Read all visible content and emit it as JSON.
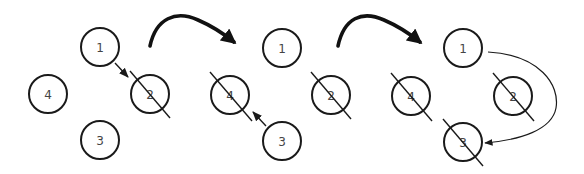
{
  "diagram": {
    "stroke_color": "#1a1a1a",
    "label_color": "#444444",
    "panels": [
      {
        "id": "panel-1",
        "nodes": [
          {
            "label": "1",
            "cx": 100,
            "cy": 47,
            "struck": false
          },
          {
            "label": "2",
            "cx": 150,
            "cy": 94,
            "struck": true
          },
          {
            "label": "3",
            "cx": 100,
            "cy": 140,
            "struck": false
          },
          {
            "label": "4",
            "cx": 48,
            "cy": 94,
            "struck": false
          }
        ],
        "arrows": [
          {
            "from": "1",
            "to": "2",
            "style": "short-dark"
          }
        ]
      },
      {
        "id": "panel-2",
        "nodes": [
          {
            "label": "1",
            "cx": 282,
            "cy": 48,
            "struck": false
          },
          {
            "label": "2",
            "cx": 331,
            "cy": 95,
            "struck": true
          },
          {
            "label": "3",
            "cx": 282,
            "cy": 141,
            "struck": false
          },
          {
            "label": "4",
            "cx": 230,
            "cy": 95,
            "struck": true
          }
        ],
        "arrows": [
          {
            "from": "3",
            "to": "4",
            "style": "short-dark"
          }
        ]
      },
      {
        "id": "panel-3",
        "nodes": [
          {
            "label": "1",
            "cx": 463,
            "cy": 48,
            "struck": false
          },
          {
            "label": "2",
            "cx": 513,
            "cy": 96,
            "struck": true
          },
          {
            "label": "3",
            "cx": 463,
            "cy": 142,
            "struck": true
          },
          {
            "label": "4",
            "cx": 411,
            "cy": 96,
            "struck": true
          }
        ],
        "arrows": [
          {
            "from": "1",
            "to": "3",
            "style": "curved-thin"
          }
        ]
      }
    ],
    "transitions": [
      {
        "from": "panel-1",
        "to": "panel-2",
        "style": "thick-curved"
      },
      {
        "from": "panel-2",
        "to": "panel-3",
        "style": "thick-curved"
      }
    ]
  }
}
